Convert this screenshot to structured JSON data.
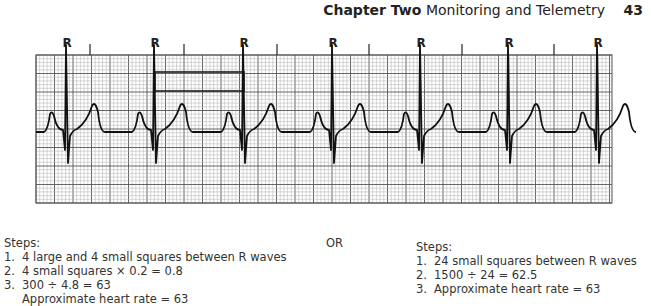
{
  "header": {
    "chapter": "Chapter Two",
    "title": "Monitoring and Telemetry",
    "page_number": "43"
  },
  "figure": {
    "r_label": "R",
    "r_wave_x": [
      67,
      155,
      244,
      333,
      421,
      509,
      598
    ],
    "tick_marks_x": [
      90,
      184,
      277,
      369,
      462,
      554
    ],
    "grid": {
      "left": 36,
      "top": 55,
      "right": 612,
      "bottom": 203,
      "small_square_px": 3.7,
      "large_square_every": 5
    },
    "measurement_box": {
      "x1": 155,
      "x2": 244,
      "y1": 72,
      "y2": 91
    },
    "colors": {
      "grid_minor": "#b0b0b0",
      "grid_major": "#555555",
      "trace": "#111111"
    }
  },
  "method_left": {
    "heading": "Steps:",
    "steps": [
      {
        "num": "1.",
        "text": "4 large and 4 small squares between R waves"
      },
      {
        "num": "2.",
        "text": "4 small squares × 0.2 = 0.8"
      },
      {
        "num": "3.",
        "text": "300 ÷ 4.8 = 63"
      }
    ],
    "result": "Approximate heart rate = 63"
  },
  "separator": "OR",
  "method_right": {
    "heading": "Steps:",
    "steps": [
      {
        "num": "1.",
        "text": "24 small squares between R waves"
      },
      {
        "num": "2.",
        "text": "1500 ÷ 24 = 62.5"
      },
      {
        "num": "3.",
        "text": "Approximate heart rate = 63"
      }
    ]
  }
}
